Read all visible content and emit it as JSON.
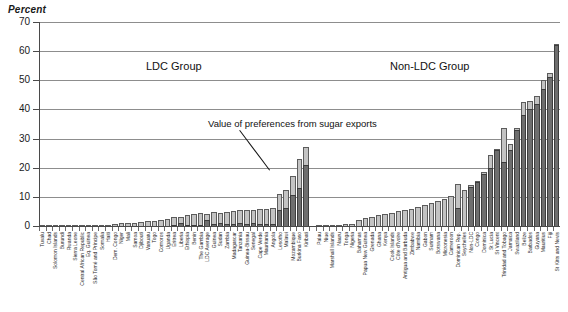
{
  "chart_data": {
    "type": "bar",
    "subtype": "stacked-bar",
    "title": "",
    "ylabel": "Percent",
    "xlabel": "",
    "ylim": [
      0,
      70
    ],
    "yticks": [
      0,
      10,
      20,
      30,
      40,
      50,
      60,
      70
    ],
    "grid": true,
    "legend_position": "none",
    "series": [
      {
        "name": "Value of preferences from sugar exports",
        "color": "#6e6e6e"
      },
      {
        "name": "Value of preferences from other exports",
        "color": "#c3c3c3"
      }
    ],
    "annotations": [
      {
        "text": "LDC Group",
        "target": "left-group"
      },
      {
        "text": "Non-LDC Group",
        "target": "right-group"
      },
      {
        "text": "Value of preferences from sugar exports",
        "target": "Kiribati"
      }
    ],
    "groups": [
      {
        "name": "LDC Group",
        "label": "LDC Group"
      },
      {
        "name": "Non-LDC Group",
        "label": "Non-LDC Group"
      }
    ],
    "categories": [
      "Tuvalu",
      "Chad",
      "Solomon Islands",
      "Burundi",
      "Rwanda",
      "Sierra Leone",
      "Central African Republic",
      "Eq. Guinea",
      "São Tomé and Príncipe",
      "Somalia",
      "Haiti",
      "Dem. Congo",
      "Niger",
      "Mali",
      "Samoa",
      "Djibouti",
      "Vanuatu",
      "Togo",
      "Comoros",
      "Uganda",
      "Eritrea",
      "Liberia",
      "Ethiopia",
      "Benin",
      "The Gambia",
      "LDC Average",
      "Guinea",
      "Sudan",
      "Zambia",
      "Madagascar",
      "Tanzania",
      "Guinea-Bissau",
      "Senegal",
      "Cape Verde",
      "Mauritania",
      "Angola",
      "Lesotho",
      "Malawi",
      "Mozambique",
      "Burkina Faso",
      "Kiribati",
      "",
      "Palau",
      "Niue",
      "Marshall Islands",
      "Nauru",
      "Tonga",
      "Nigeria",
      "Bahamas",
      "Papua New Guinea",
      "Grenada",
      "Ghana",
      "Kenya",
      "Cook Islands",
      "Côte d'Ivoire",
      "Antigua and Barbuda",
      "Zimbabwe",
      "Namibia",
      "Gabon",
      "Surinam",
      "Botswana",
      "Micronesia",
      "Cameroon",
      "Dominican Rep.",
      "Seychelles",
      "Non-LDC",
      "Congo",
      "Dominica",
      "St Lucia",
      "St Vincent",
      "Trinidad and Tobago",
      "Jamaica",
      "Swaziland",
      "Belize",
      "Barbados",
      "Guyana",
      "Mauritius",
      "Fiji",
      "St Kitts and Nevis"
    ],
    "sugar_values": [
      0.0,
      0.0,
      0.0,
      0.0,
      0.0,
      0.0,
      0.0,
      0.0,
      0.0,
      0.0,
      0.0,
      0.0,
      0.0,
      0.0,
      0.0,
      0.0,
      0.0,
      0.0,
      0.0,
      0.0,
      0.3,
      1.0,
      0.4,
      0.5,
      0.4,
      2.0,
      0.6,
      1.2,
      0.6,
      0.6,
      1.0,
      0.7,
      1.0,
      0.6,
      0.7,
      0.7,
      5.6,
      6.2,
      10.5,
      13.0,
      21.0,
      0.0,
      0.0,
      0.0,
      0.0,
      0.0,
      0.0,
      0.0,
      0.0,
      0.0,
      0.0,
      0.0,
      0.0,
      0.0,
      0.0,
      0.0,
      0.0,
      0.0,
      0.0,
      0.0,
      0.0,
      0.0,
      0.0,
      6.3,
      0.0,
      13.5,
      15.0,
      18.0,
      20.0,
      26.0,
      22.0,
      26.0,
      33.0,
      38.0,
      40.0,
      42.0,
      47.0,
      51.0,
      62.0
    ],
    "other_values": [
      0.1,
      0.1,
      0.1,
      0.2,
      0.2,
      0.2,
      0.3,
      0.3,
      0.4,
      0.4,
      0.5,
      0.6,
      0.9,
      1.0,
      1.2,
      1.3,
      1.6,
      1.8,
      2.2,
      2.5,
      2.7,
      2.0,
      3.3,
      3.6,
      3.9,
      2.0,
      4.2,
      3.3,
      4.3,
      4.5,
      4.4,
      4.8,
      4.5,
      5.2,
      5.3,
      5.6,
      5.4,
      6.0,
      6.5,
      10.0,
      6.0,
      0.0,
      0.2,
      0.3,
      0.4,
      0.5,
      0.6,
      0.8,
      2.1,
      2.6,
      3.1,
      3.7,
      4.2,
      4.6,
      5.0,
      5.4,
      5.9,
      6.5,
      7.2,
      7.8,
      8.6,
      9.3,
      10.3,
      8.2,
      12.2,
      0.5,
      0.5,
      0.6,
      4.5,
      0.5,
      11.5,
      2.0,
      0.6,
      4.5,
      3.0,
      2.5,
      3.0,
      1.5,
      0.5
    ]
  },
  "axis": {
    "y_title": "Percent",
    "y_tick_labels": [
      "70",
      "60",
      "50",
      "40",
      "30",
      "20",
      "10",
      "0"
    ]
  },
  "labels": {
    "ldc_group": "LDC Group",
    "non_ldc_group": "Non-LDC Group",
    "callout": "Value of preferences from sugar exports"
  }
}
